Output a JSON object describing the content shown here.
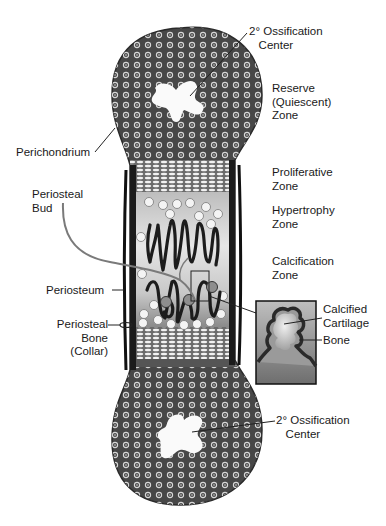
{
  "diagram": {
    "colors": {
      "epiphysis_fill": "#4a4a4a",
      "periosteum": "#1e1e1e",
      "cartilage_light": "#d4d4d4",
      "background": "#ffffff",
      "label_text": "#1a1a1a"
    },
    "labels": {
      "secondary_ossification_top": "2° Ossification\n   Center",
      "reserve_zone": "Reserve\n(Quiescent)\nZone",
      "perichondrium": "Perichondrium",
      "proliferative_zone": "Proliferative\nZone",
      "periosteal_bud": "Periosteal\nBud",
      "hypertrophy_zone": "Hypertrophy\nZone",
      "calcification_zone": "Calcification\nZone",
      "periosteum": "Periosteum",
      "calcified_cartilage": "Calcified\nCartilage",
      "periosteal_bone": "Periosteal\nBone\n(Collar)",
      "bone": "Bone",
      "secondary_ossification_bottom": "2° Ossification\n   Center"
    },
    "inset": {
      "description": "Magnified view of calcified cartilage core with bone covering"
    }
  }
}
